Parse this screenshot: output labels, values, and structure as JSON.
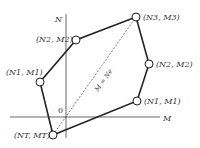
{
  "diagram": {
    "axes": {
      "vertical_label": "N",
      "horizontal_label": "M",
      "origin_label": "0"
    },
    "diagonal_label": "M = Ne",
    "points": [
      {
        "id": "left-n1m1",
        "label": "(N1, M1)"
      },
      {
        "id": "left-n2m2",
        "label": "(N2, M2)"
      },
      {
        "id": "n3m3",
        "label": "(N3, M3)"
      },
      {
        "id": "right-n2m2",
        "label": "(N2, M2)"
      },
      {
        "id": "right-n1m1",
        "label": "(N1, M1)"
      },
      {
        "id": "ntmt",
        "label": "(NT, MT)"
      }
    ],
    "colors": {
      "line": "#222222",
      "axis": "#666666",
      "text": "#333333"
    }
  }
}
